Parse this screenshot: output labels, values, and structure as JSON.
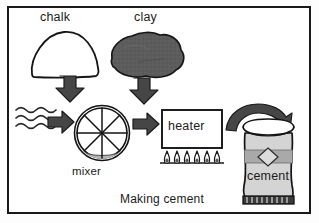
{
  "figure": {
    "caption": "Making cement",
    "frame_color": "#1a1a1a",
    "background": "#ffffff"
  },
  "labels": {
    "chalk": "chalk",
    "clay": "clay",
    "mixer": "mixer",
    "heater": "heater",
    "cement": "cement"
  },
  "icons": {
    "chalk_mound": "chalk-mound-icon",
    "clay_blob": "clay-blob-icon",
    "water_waves": "water-waves-icon",
    "mixer_wheel": "mixer-wheel-icon",
    "heater_box": "heater-box-icon",
    "flames": "flames-icon",
    "cement_bag": "cement-bag-icon",
    "arrow_chalk_down": "arrow-down-icon",
    "arrow_clay_down": "arrow-down-icon",
    "arrow_water_right": "arrow-right-icon",
    "arrow_mixer_right": "arrow-right-icon",
    "arrow_heater_curve": "arrow-curved-icon"
  },
  "colors": {
    "outline": "#1a1a1a",
    "arrow_fill": "#4a4a4a",
    "clay_fill": "#5c5c5c",
    "bag_fill": "#d4d4d4",
    "bag_band": "#a9a9a9",
    "mixer_slurry": "#b5b5b5",
    "water_line": "#2b2b2b",
    "white": "#ffffff"
  },
  "flow": {
    "inputs": [
      "chalk",
      "clay",
      "water"
    ],
    "steps": [
      "mixer",
      "heater"
    ],
    "output": "cement"
  },
  "counts": {
    "flames": 6,
    "water_waves": 3,
    "mixer_spokes": 8
  }
}
